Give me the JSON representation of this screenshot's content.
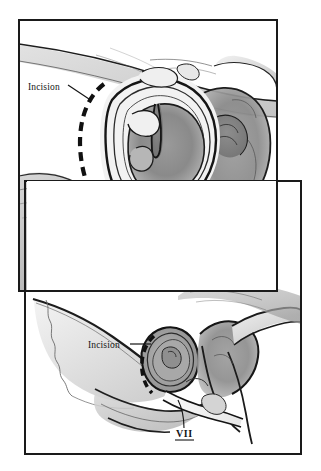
{
  "figure": {
    "background_color": "#ffffff",
    "ink_color": "#151515",
    "panels": [
      {
        "id": "top-panel",
        "name": "close-up-operative-view",
        "frame": {
          "x": 18,
          "y": 19,
          "width": 260,
          "height": 273
        },
        "border_color": "#1a1a1a",
        "labels": [
          {
            "id": "incision-label-top",
            "text": "Incision",
            "x": 28,
            "y": 87,
            "leader": {
              "type": "diagonal",
              "x1": 68,
              "y1": 87,
              "x2": 90,
              "y2": 102
            }
          },
          {
            "id": "nerve-label-top",
            "text": "VII",
            "x": 190,
            "y": 252,
            "underlined": true
          }
        ],
        "incision_marker": {
          "style": "thick-dashed-arc",
          "description": "post-auricular dashed incision arc"
        }
      },
      {
        "id": "bottom-panel",
        "name": "lateral-skull-overview",
        "frame": {
          "x": 24,
          "y": 180,
          "width": 278,
          "height": 275
        },
        "border_color": "#1a1a1a",
        "labels": [
          {
            "id": "incision-label-bottom",
            "text": "Incision",
            "x": 88,
            "y": 347,
            "leader": {
              "type": "horizontal",
              "x1": 130,
              "y1": 344,
              "x2": 150,
              "y2": 344
            }
          },
          {
            "id": "nerve-label-bottom",
            "text": "VII",
            "x": 176,
            "y": 434,
            "underlined": true
          }
        ],
        "incision_marker": {
          "style": "thick-dashed-arc",
          "description": "post-auricular dashed incision arc"
        }
      }
    ],
    "legend_terms": {
      "incision": "Incision",
      "facial_nerve": "VII"
    }
  }
}
